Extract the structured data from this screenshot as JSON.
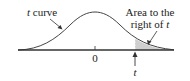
{
  "diagram": {
    "curve_label": {
      "var": "t",
      "text": " curve"
    },
    "area_label": {
      "line1": "Area to the",
      "line2_prefix": "right of ",
      "line2_var": "t"
    },
    "center_tick_label": "0",
    "t_marker_label": "t",
    "colors": {
      "curve": "#444444",
      "axis": "#333333",
      "shade": "#cfcfcf",
      "text": "#222222"
    }
  }
}
